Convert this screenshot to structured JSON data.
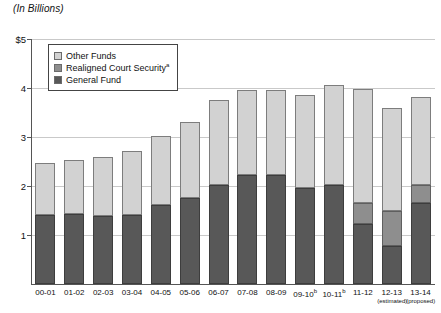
{
  "chart_data": {
    "type": "bar",
    "subtype": "stacked",
    "title": "(In Billions)",
    "xlabel": "",
    "ylabel": "",
    "ylim": [
      0,
      5
    ],
    "yticks": [
      0,
      1,
      2,
      3,
      4,
      5
    ],
    "ytick_labels": [
      "",
      "1",
      "2",
      "3",
      "4",
      "$5"
    ],
    "grid": true,
    "legend_position": "upper-left-inside",
    "categories": [
      "00-01",
      "01-02",
      "02-03",
      "03-04",
      "04-05",
      "05-06",
      "06-07",
      "07-08",
      "08-09",
      "09-10",
      "10-11",
      "11-12",
      "12-13",
      "13-14"
    ],
    "category_superscripts": [
      "",
      "",
      "",
      "",
      "",
      "",
      "",
      "",
      "",
      "b",
      "b",
      "",
      "",
      ""
    ],
    "category_sublabels": [
      "",
      "",
      "",
      "",
      "",
      "",
      "",
      "",
      "",
      "",
      "",
      "",
      "(estimated)",
      "(proposed)"
    ],
    "series": [
      {
        "name": "General Fund",
        "color": "#585858",
        "values": [
          1.41,
          1.43,
          1.39,
          1.41,
          1.61,
          1.76,
          2.02,
          2.22,
          2.22,
          1.96,
          2.02,
          1.22,
          0.78,
          1.65
        ]
      },
      {
        "name": "Realigned Court Security",
        "color": "#8e8e8e",
        "footnote": "a",
        "values": [
          0,
          0,
          0,
          0,
          0,
          0,
          0,
          0,
          0,
          0,
          0,
          0.43,
          0.71,
          0.37
        ]
      },
      {
        "name": "Other Funds",
        "color": "#d2d2d2",
        "values": [
          1.06,
          1.1,
          1.2,
          1.31,
          1.41,
          1.54,
          1.73,
          1.73,
          1.73,
          1.9,
          2.04,
          2.33,
          2.11,
          1.8
        ]
      }
    ],
    "totals": [
      2.47,
      2.53,
      2.59,
      2.72,
      3.02,
      3.3,
      3.75,
      3.95,
      3.95,
      3.86,
      4.06,
      3.98,
      3.6,
      3.82
    ]
  },
  "legend": {
    "items": [
      {
        "label": "Other Funds",
        "sup": "",
        "color": "#d2d2d2"
      },
      {
        "label": "Realigned Court Security",
        "sup": "a",
        "color": "#8e8e8e"
      },
      {
        "label": "General Fund",
        "sup": "",
        "color": "#585858"
      }
    ]
  },
  "colors": {
    "general_fund": "#585858",
    "realigned_court_security": "#8e8e8e",
    "other_funds": "#d2d2d2",
    "gridline": "#c9c9c9",
    "axis": "#555555",
    "background": "#ffffff"
  }
}
